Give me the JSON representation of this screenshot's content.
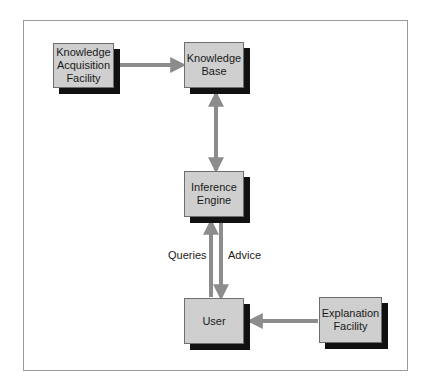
{
  "diagram": {
    "nodes": [
      {
        "id": "kaf",
        "label": "Knowledge\nAcquisition\nFacility"
      },
      {
        "id": "kb",
        "label": "Knowledge\nBase"
      },
      {
        "id": "ie",
        "label": "Inference\nEngine"
      },
      {
        "id": "user",
        "label": "User"
      },
      {
        "id": "ef",
        "label": "Explanation\nFacility"
      }
    ],
    "edges": [
      {
        "from": "kaf",
        "to": "kb",
        "label": ""
      },
      {
        "from": "kb",
        "to": "ie",
        "label": "",
        "bidirectional": true
      },
      {
        "from": "user",
        "to": "ie",
        "label": "Queries"
      },
      {
        "from": "ie",
        "to": "user",
        "label": "Advice"
      },
      {
        "from": "ef",
        "to": "user",
        "label": ""
      }
    ],
    "labels": {
      "queries": "Queries",
      "advice": "Advice"
    },
    "colors": {
      "box_fill": "#cfcfcf",
      "shadow": "#111111",
      "arrow": "#8c8c8c",
      "frame": "#9a9a9a"
    }
  }
}
